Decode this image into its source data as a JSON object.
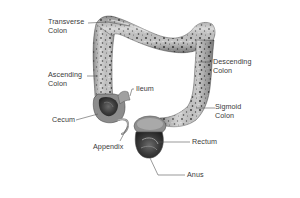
{
  "diagram": {
    "colors": {
      "background": "#ffffff",
      "label_text": "#3a3a3a",
      "leader_line": "#555555",
      "tissue_light": "#d9d9d9",
      "tissue_mid": "#a8a8a8",
      "tissue_dark": "#3c3c3c"
    },
    "labels": {
      "transverse_colon": {
        "line1": "Transverse",
        "line2": "Colon"
      },
      "ascending_colon": {
        "line1": "Ascending",
        "line2": "Colon"
      },
      "descending_colon": {
        "line1": "Descending",
        "line2": "Colon"
      },
      "ileum": {
        "line1": "Ileum"
      },
      "cecum": {
        "line1": "Cecum"
      },
      "sigmoid_colon": {
        "line1": "Sigmoid",
        "line2": "Colon"
      },
      "rectum": {
        "line1": "Rectum"
      },
      "appendix": {
        "line1": "Appendix"
      },
      "anus": {
        "line1": "Anus"
      }
    }
  }
}
